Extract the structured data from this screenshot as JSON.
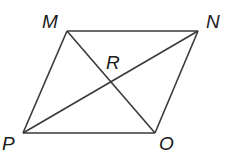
{
  "diagram": {
    "type": "parallelogram with diagonals",
    "stroke_color": "#3a3a3a",
    "label_color": "#1a1a1a",
    "vertices": {
      "M": {
        "label": "M",
        "x": 67,
        "y": 31
      },
      "N": {
        "label": "N",
        "x": 198,
        "y": 31
      },
      "O": {
        "label": "O",
        "x": 155,
        "y": 133
      },
      "P": {
        "label": "P",
        "x": 23,
        "y": 133
      }
    },
    "intersection": {
      "label": "R",
      "x": 111,
      "y": 82
    },
    "sides": [
      "MN",
      "NO",
      "OP",
      "PM"
    ],
    "diagonals": [
      "MO",
      "NP"
    ]
  }
}
